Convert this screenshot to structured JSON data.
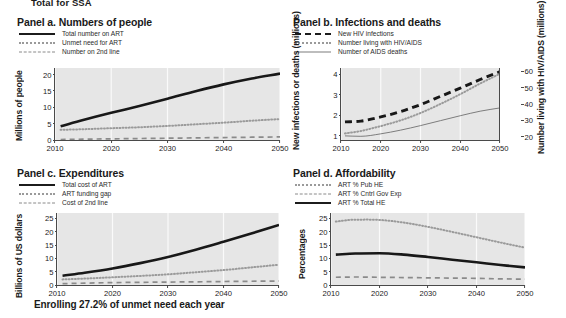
{
  "figure": {
    "suptitle": "Total for SSA",
    "caption": "Enrolling 27.2% of unmet need each year",
    "xticks": [
      "2010",
      "2020",
      "2030",
      "2040",
      "2050"
    ]
  },
  "panel_a": {
    "title": "Panel a. Numbers of people",
    "ylabel": "Millions of people",
    "legend": [
      {
        "label": "Total number on ART",
        "style": "solid-thick"
      },
      {
        "label": "Unmet need for ART",
        "style": "dotted"
      },
      {
        "label": "Number on 2nd line",
        "style": "dashed"
      }
    ],
    "yticks": [
      "0",
      "5",
      "10",
      "15",
      "20"
    ]
  },
  "panel_b": {
    "title": "Panel b. Infections and deaths",
    "ylabel": "New infections or deaths (millions)",
    "ylabel_right": "Number living with HIV/AIDS (millions)",
    "legend": [
      {
        "label": "New HIV infections",
        "style": "dashed-thick"
      },
      {
        "label": "Number living with HIV/AIDS",
        "style": "dotted"
      },
      {
        "label": "Number of AIDS deaths",
        "style": "solid-thin"
      }
    ],
    "yticks": [
      "1",
      "2",
      "3",
      "4"
    ],
    "yticks_right": [
      "20",
      "30",
      "40",
      "50",
      "60"
    ]
  },
  "panel_c": {
    "title": "Panel c. Expenditures",
    "ylabel": "Billions of  US dollars",
    "legend": [
      {
        "label": "Total cost of ART",
        "style": "solid-thick"
      },
      {
        "label": "ART funding gap",
        "style": "dotted"
      },
      {
        "label": "Cost of 2nd line",
        "style": "dashed"
      }
    ],
    "yticks": [
      "0",
      "5",
      "10",
      "15",
      "20",
      "25"
    ]
  },
  "panel_d": {
    "title": "Panel d. Affordability",
    "ylabel": "Percentages",
    "legend": [
      {
        "label": "ART % Pub HE",
        "style": "dotted"
      },
      {
        "label": "ART % Cntrl Gov Exp",
        "style": "dashed"
      },
      {
        "label": "ART % Total HE",
        "style": "solid-thick"
      }
    ],
    "yticks": [
      "0",
      "5",
      "10",
      "15",
      "20",
      "25"
    ]
  },
  "chart_data": [
    {
      "id": "panel_a",
      "type": "line",
      "title": "Panel a. Numbers of people",
      "xlabel": "",
      "ylabel": "Millions of people",
      "xlim": [
        2010,
        2050
      ],
      "ylim": [
        0,
        22
      ],
      "yticks": [
        0,
        5,
        10,
        15,
        20
      ],
      "xticks": [
        2010,
        2020,
        2030,
        2040,
        2050
      ],
      "grid": true,
      "legend_position": "above-plot",
      "x": [
        2011,
        2015,
        2020,
        2025,
        2030,
        2035,
        2040,
        2045,
        2050
      ],
      "series": [
        {
          "name": "Total number on ART",
          "style": "solid-thick",
          "values": [
            4.2,
            6.1,
            8.3,
            10.4,
            12.6,
            14.9,
            17.0,
            18.8,
            20.3
          ]
        },
        {
          "name": "Unmet need for ART",
          "style": "dotted",
          "values": [
            3.1,
            3.3,
            3.6,
            3.9,
            4.3,
            4.8,
            5.3,
            5.9,
            6.4
          ]
        },
        {
          "name": "Number on 2nd line",
          "style": "dashed",
          "values": [
            0.15,
            0.25,
            0.35,
            0.45,
            0.55,
            0.65,
            0.75,
            0.85,
            0.95
          ]
        }
      ]
    },
    {
      "id": "panel_b",
      "type": "line",
      "title": "Panel b. Infections and deaths",
      "xlabel": "",
      "ylabel": "New infections or deaths (millions)",
      "ylabel_right": "Number living with HIV/AIDS (millions)",
      "xlim": [
        2010,
        2050
      ],
      "ylim": [
        0.8,
        4.3
      ],
      "ylim_right": [
        18,
        62
      ],
      "yticks": [
        1,
        2,
        3,
        4
      ],
      "yticks_right": [
        20,
        30,
        40,
        50,
        60
      ],
      "xticks": [
        2010,
        2020,
        2030,
        2040,
        2050
      ],
      "grid": true,
      "legend_position": "above-plot",
      "x": [
        2011,
        2015,
        2020,
        2025,
        2030,
        2035,
        2040,
        2045,
        2050
      ],
      "series": [
        {
          "name": "New HIV infections",
          "style": "dashed-thick",
          "axis": "left",
          "values": [
            1.68,
            1.72,
            1.92,
            2.18,
            2.52,
            2.92,
            3.32,
            3.74,
            4.12
          ]
        },
        {
          "name": "Number living with HIV/AIDS",
          "style": "dotted",
          "axis": "right",
          "values": [
            22.0,
            23.5,
            26.5,
            30.0,
            34.5,
            40.0,
            46.0,
            52.5,
            58.5
          ]
        },
        {
          "name": "Number of AIDS deaths",
          "style": "solid-thin",
          "axis": "left",
          "values": [
            1.0,
            0.98,
            1.1,
            1.28,
            1.5,
            1.74,
            1.98,
            2.2,
            2.36
          ]
        }
      ]
    },
    {
      "id": "panel_c",
      "type": "line",
      "title": "Panel c. Expenditures",
      "xlabel": "",
      "ylabel": "Billions of  US dollars",
      "xlim": [
        2010,
        2050
      ],
      "ylim": [
        0,
        27
      ],
      "yticks": [
        0,
        5,
        10,
        15,
        20,
        25
      ],
      "xticks": [
        2010,
        2020,
        2030,
        2040,
        2050
      ],
      "grid": true,
      "legend_position": "above-plot",
      "x": [
        2011,
        2015,
        2020,
        2025,
        2030,
        2035,
        2040,
        2045,
        2050
      ],
      "series": [
        {
          "name": "Total cost of ART",
          "style": "solid-thick",
          "values": [
            3.5,
            4.6,
            6.2,
            8.2,
            10.5,
            13.2,
            16.2,
            19.3,
            22.5
          ]
        },
        {
          "name": "ART funding gap",
          "style": "dotted",
          "values": [
            2.1,
            2.4,
            2.9,
            3.4,
            4.0,
            4.8,
            5.6,
            6.6,
            7.6
          ]
        },
        {
          "name": "Cost of 2nd line",
          "style": "dashed",
          "values": [
            0.5,
            0.7,
            0.9,
            1.0,
            1.1,
            1.2,
            1.3,
            1.4,
            1.5
          ]
        }
      ]
    },
    {
      "id": "panel_d",
      "type": "line",
      "title": "Panel d. Affordability",
      "xlabel": "",
      "ylabel": "Percentages",
      "xlim": [
        2010,
        2050
      ],
      "ylim": [
        0,
        27
      ],
      "yticks": [
        0,
        5,
        10,
        15,
        20,
        25
      ],
      "xticks": [
        2010,
        2020,
        2030,
        2040,
        2050
      ],
      "grid": true,
      "legend_position": "above-plot",
      "x": [
        2011,
        2015,
        2020,
        2025,
        2030,
        2035,
        2040,
        2045,
        2050
      ],
      "series": [
        {
          "name": "ART % Pub HE",
          "style": "dotted",
          "values": [
            23.8,
            24.5,
            24.4,
            23.4,
            21.8,
            19.9,
            17.9,
            15.9,
            14.0
          ]
        },
        {
          "name": "ART % Cntrl Gov Exp",
          "style": "dashed",
          "values": [
            2.9,
            3.0,
            2.9,
            2.8,
            2.7,
            2.6,
            2.5,
            2.3,
            2.2
          ]
        },
        {
          "name": "ART % Total HE",
          "style": "solid-thick",
          "values": [
            11.4,
            11.8,
            11.9,
            11.4,
            10.5,
            9.5,
            8.5,
            7.5,
            6.6
          ]
        }
      ]
    }
  ]
}
